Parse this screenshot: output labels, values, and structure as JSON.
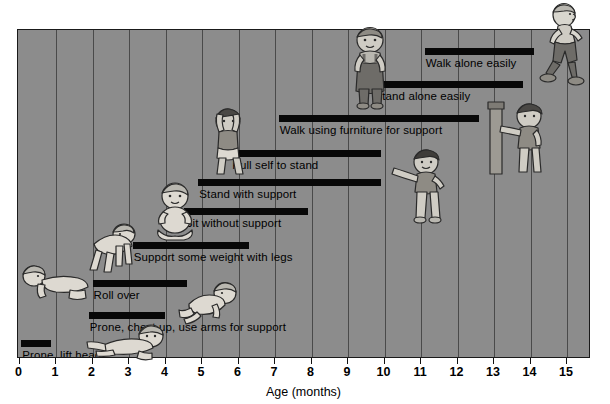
{
  "chart_data": {
    "type": "bar",
    "orientation": "horizontal-range",
    "title": "",
    "xlabel": "Age (months)",
    "ylabel": "",
    "xlim": [
      0,
      15.7
    ],
    "xticks": [
      0,
      1,
      2,
      3,
      4,
      5,
      6,
      7,
      8,
      9,
      10,
      11,
      12,
      13,
      14,
      15
    ],
    "xticklabels": [
      "0",
      "1",
      "2",
      "3",
      "4",
      "5",
      "6",
      "7",
      "8",
      "9",
      "10",
      "11",
      "12",
      "13",
      "14",
      "15"
    ],
    "grid": true,
    "grid_axis": "x",
    "legend": "none",
    "bar_color": "#080808",
    "plot_background": "#8c8c8c",
    "categories": [
      "Walk alone easily",
      "Stand alone easily",
      "Walk using furniture for support",
      "Pull self to stand",
      "Stand with support",
      "Sit without support",
      "Support some weight with legs",
      "Roll over",
      "Prone, chest up, use arms for support",
      "Prone, lift head"
    ],
    "bars": [
      {
        "label": "Walk alone easily",
        "start": 11.1,
        "end": 14.1,
        "row": 0
      },
      {
        "label": "Stand alone easily",
        "start": 9.7,
        "end": 13.8,
        "row": 1
      },
      {
        "label": "Walk using furniture for support",
        "start": 7.1,
        "end": 12.6,
        "row": 2
      },
      {
        "label": "Pull self to stand",
        "start": 5.8,
        "end": 9.9,
        "row": 3
      },
      {
        "label": "Stand with support",
        "start": 4.9,
        "end": 9.9,
        "row": 4
      },
      {
        "label": "Sit without support",
        "start": 4.5,
        "end": 7.9,
        "row": 5
      },
      {
        "label": "Support some weight with legs",
        "start": 3.1,
        "end": 6.3,
        "row": 6
      },
      {
        "label": "Roll over",
        "start": 2.0,
        "end": 4.6,
        "row": 7
      },
      {
        "label": "Prone, chest up, use arms for support",
        "start": 1.9,
        "end": 4.0,
        "row": 8
      },
      {
        "label": "Prone, lift head",
        "start": 0.05,
        "end": 0.85,
        "row": 9
      }
    ]
  },
  "axis": {
    "label": "Age (months)",
    "ticks": [
      "0",
      "1",
      "2",
      "3",
      "4",
      "5",
      "6",
      "7",
      "8",
      "9",
      "10",
      "11",
      "12",
      "13",
      "14",
      "15"
    ]
  },
  "bars": [
    {
      "name": "bar-walk-alone-easily",
      "label": "Walk alone easily"
    },
    {
      "name": "bar-stand-alone-easily",
      "label": "Stand alone easily"
    },
    {
      "name": "bar-walk-using-furniture",
      "label": "Walk using furniture for support"
    },
    {
      "name": "bar-pull-self-to-stand",
      "label": "Pull self to stand"
    },
    {
      "name": "bar-stand-with-support",
      "label": "Stand with support"
    },
    {
      "name": "bar-sit-without-support",
      "label": "Sit without support"
    },
    {
      "name": "bar-support-some-weight",
      "label": "Support some weight with legs"
    },
    {
      "name": "bar-roll-over",
      "label": "Roll over"
    },
    {
      "name": "bar-prone-chest-up",
      "label": "Prone, chest up, use arms for support"
    },
    {
      "name": "bar-prone-lift-head",
      "label": "Prone, lift head"
    }
  ],
  "figures": [
    {
      "name": "toddler-running-figure",
      "pose": "running-toddler"
    },
    {
      "name": "toddler-standing-overalls",
      "pose": "standing-toddler-overalls"
    },
    {
      "name": "toddler-cruising-furniture",
      "pose": "toddler-holding-furniture"
    },
    {
      "name": "toddler-standing-alone",
      "pose": "standing-toddler-arms-out"
    },
    {
      "name": "baby-pulling-to-stand",
      "pose": "baby-pulling-up"
    },
    {
      "name": "baby-standing-supported",
      "pose": "baby-supported-legs"
    },
    {
      "name": "baby-sitting-unsupported",
      "pose": "baby-sitting"
    },
    {
      "name": "baby-crawling",
      "pose": "baby-on-hands-knees"
    },
    {
      "name": "baby-rolling-over",
      "pose": "baby-rolling"
    },
    {
      "name": "baby-prone-chest-up",
      "pose": "baby-prone-arms"
    },
    {
      "name": "baby-prone-lift-head",
      "pose": "baby-prone-head-up"
    }
  ],
  "colors": {
    "plot_background": "#8c8c8c",
    "bar": "#080808",
    "gridline": "#4a4a4a",
    "border": "#1a1a1a",
    "figure_light": "#e8e6df",
    "figure_mid": "#b9b7b0",
    "figure_dark": "#6e6c68",
    "outline": "#2a2a2a",
    "text": "#000000"
  }
}
